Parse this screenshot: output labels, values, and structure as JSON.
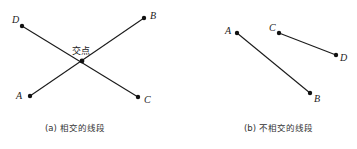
{
  "figures": [
    {
      "id": "a",
      "caption": "(a) 相交的线段",
      "intersection_label": "交点",
      "points": {
        "A": "A",
        "B": "B",
        "C": "C",
        "D": "D"
      },
      "segments": [
        [
          "A",
          "B"
        ],
        [
          "D",
          "C"
        ]
      ],
      "intersecting": true
    },
    {
      "id": "b",
      "caption": "(b) 不相交的线段",
      "points": {
        "A": "A",
        "B": "B",
        "C": "C",
        "D": "D"
      },
      "segments": [
        [
          "A",
          "B"
        ],
        [
          "C",
          "D"
        ]
      ],
      "intersecting": false
    }
  ],
  "colors": {
    "line": "#1a1a1a",
    "point": "#111111",
    "text": "#222222"
  }
}
